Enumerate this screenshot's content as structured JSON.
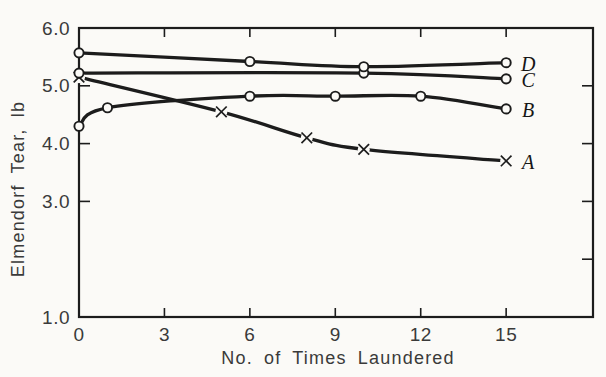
{
  "colors": {
    "paper": "#fbfaf7",
    "ink": "#1c1c1c",
    "text": "#3a3a3a"
  },
  "chart_data": {
    "type": "line",
    "title": "",
    "xlabel": "No. of Times Laundered",
    "ylabel": "Elmendorf Tear, lb",
    "xlim": [
      0,
      18.05
    ],
    "ylim": [
      1.0,
      6.0
    ],
    "grid": false,
    "legend_position": "end-of-line",
    "x_ticks": [
      0,
      3,
      6,
      9,
      12,
      15
    ],
    "y_ticks_left": [
      {
        "value": 6.0,
        "label": "6.0"
      },
      {
        "value": 5.0,
        "label": "5.0"
      },
      {
        "value": 4.0,
        "label": "4.0"
      },
      {
        "value": 3.0,
        "label": "3.0"
      },
      {
        "value": 1.0,
        "label": "1.0"
      }
    ],
    "y_ticks_right": [
      5.0,
      4.0,
      3.0,
      2.0
    ],
    "series": [
      {
        "name": "D",
        "marker": "circle",
        "x": [
          0,
          6,
          10,
          15
        ],
        "y": [
          5.57,
          5.42,
          5.33,
          5.4
        ]
      },
      {
        "name": "C",
        "marker": "circle",
        "x": [
          0,
          10,
          15
        ],
        "y": [
          5.22,
          5.22,
          5.12
        ]
      },
      {
        "name": "B",
        "marker": "circle",
        "x": [
          0,
          1,
          6,
          9,
          12,
          15
        ],
        "y": [
          4.3,
          4.62,
          4.82,
          4.82,
          4.82,
          4.6
        ]
      },
      {
        "name": "A",
        "marker": "x",
        "x": [
          0,
          5,
          8,
          10,
          15
        ],
        "y": [
          5.15,
          4.55,
          4.1,
          3.9,
          3.7
        ]
      }
    ]
  }
}
